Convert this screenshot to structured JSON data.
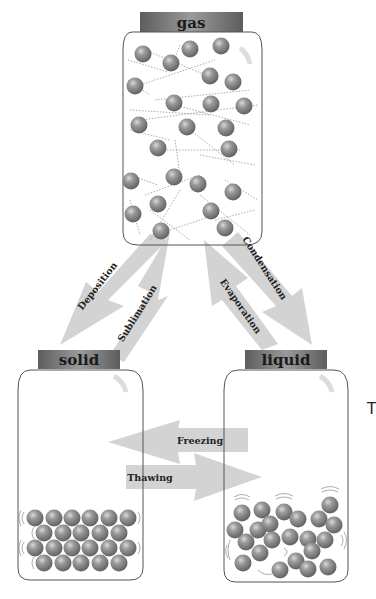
{
  "diagram": {
    "states": {
      "gas": {
        "label": "gas"
      },
      "solid": {
        "label": "solid"
      },
      "liquid": {
        "label": "liquid"
      }
    },
    "transitions": {
      "deposition": {
        "label": "Deposition",
        "from": "gas",
        "to": "solid"
      },
      "sublimation": {
        "label": "Sublimation",
        "from": "solid",
        "to": "gas"
      },
      "condensation": {
        "label": "Condensation",
        "from": "gas",
        "to": "liquid"
      },
      "evaporation": {
        "label": "Evaporation",
        "from": "liquid",
        "to": "gas"
      },
      "freezing": {
        "label": "Freezing",
        "from": "liquid",
        "to": "solid"
      },
      "thawing": {
        "label": "Thawing",
        "from": "solid",
        "to": "liquid"
      }
    },
    "stray_text": "T",
    "colors": {
      "arrow": "#d3d3d3",
      "lid": "#7a7a7a",
      "molecule": "#8a8a8a",
      "jar_outline": "#555555"
    }
  }
}
